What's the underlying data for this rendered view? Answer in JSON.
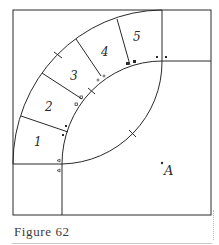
{
  "figure": {
    "caption": "Figure 62",
    "point_label": "A",
    "sections": [
      {
        "label": "1"
      },
      {
        "label": "2"
      },
      {
        "label": "3"
      },
      {
        "label": "4"
      },
      {
        "label": "5"
      }
    ],
    "colors": {
      "line": "#2a2a2a",
      "background": "#ffffff",
      "caption": "#3a3a3a"
    }
  }
}
